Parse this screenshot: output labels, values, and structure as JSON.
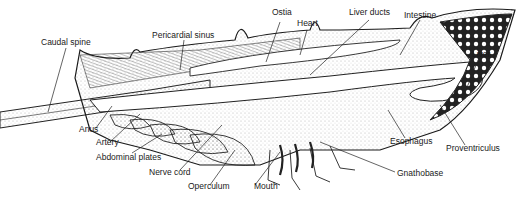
{
  "diagram": {
    "labels": {
      "caudal_spine": "Caudal spine",
      "pericardial_sinus": "Pericardial sinus",
      "ostia": "Ostia",
      "heart": "Heart",
      "liver_ducts": "Liver ducts",
      "intestine": "Intestine",
      "liver": "Liver",
      "anus": "Anus",
      "artery": "Artery",
      "abdominal_plates": "Abdominal plates",
      "nerve_cord": "Nerve cord",
      "operculum": "Operculum",
      "mouth": "Mouth",
      "esophagus": "Esophagus",
      "proventriculus": "Proventriculus",
      "gnathobase": "Gnathobase"
    },
    "colors": {
      "ink": "#1a1a1a",
      "stipple": "#555555",
      "background": "#ffffff"
    }
  }
}
